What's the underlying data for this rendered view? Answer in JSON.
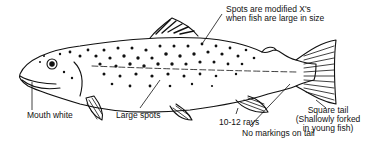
{
  "diagram": {
    "colors": {
      "ink": "#111111",
      "background": "#ffffff"
    },
    "labels": {
      "spots_x": [
        "Spots are modified X's",
        "when fish are large in size"
      ],
      "mouth": "Mouth white",
      "large_spots": "Large spots",
      "rays": "10-12 rays",
      "tail": [
        "Square tail",
        "(Shallowly forked",
        "in young fish)"
      ],
      "no_markings": "No markings on tail"
    }
  }
}
